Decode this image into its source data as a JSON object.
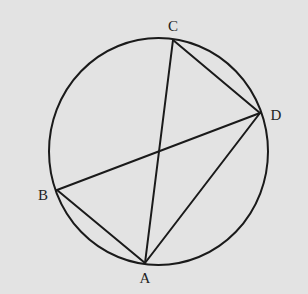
{
  "diagram": {
    "type": "inscribed-quadrilateral",
    "background": "#e3e3e3",
    "stroke": "#1a1a1a",
    "circle": {
      "cx": 158.5,
      "cy": 151.5,
      "rx": 109.5,
      "ry": 113.5
    },
    "points": {
      "A": {
        "x": 145,
        "y": 263,
        "label": "A",
        "lx": 145,
        "ly": 283
      },
      "B": {
        "x": 57,
        "y": 190,
        "label": "B",
        "lx": 43,
        "ly": 200
      },
      "C": {
        "x": 173,
        "y": 40,
        "label": "C",
        "lx": 173,
        "ly": 31
      },
      "D": {
        "x": 260,
        "y": 113,
        "label": "D",
        "lx": 276,
        "ly": 120
      }
    },
    "segments": [
      [
        "B",
        "A"
      ],
      [
        "A",
        "C"
      ],
      [
        "A",
        "D"
      ],
      [
        "B",
        "D"
      ],
      [
        "C",
        "D"
      ]
    ]
  }
}
